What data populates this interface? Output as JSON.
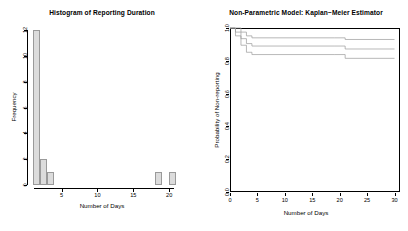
{
  "figure": {
    "background": "#ffffff",
    "panel_count": 2
  },
  "chart_data": [
    {
      "type": "bar",
      "id": "histogram-reporting-duration",
      "title": "Histogram of Reporting Duration",
      "xlabel": "Number of Days",
      "ylabel": "Frequency",
      "xlim": [
        0.6,
        21.5
      ],
      "ylim": [
        0,
        12
      ],
      "xticks": [
        5,
        10,
        15,
        20
      ],
      "yticks": [
        0,
        2,
        4,
        6,
        8,
        10,
        12
      ],
      "grid": false,
      "legend": "none",
      "bin_width": 1,
      "bar_color": "#dcdcdc",
      "bar_border": "#9a9a9a",
      "bins": [
        {
          "x0": 1,
          "x1": 2,
          "value": 12
        },
        {
          "x0": 2,
          "x1": 3,
          "value": 2
        },
        {
          "x0": 3,
          "x1": 4,
          "value": 1
        },
        {
          "x0": 18,
          "x1": 19,
          "value": 1
        },
        {
          "x0": 20,
          "x1": 21,
          "value": 1
        }
      ],
      "categories": [
        "1-2",
        "2-3",
        "3-4",
        "18-19",
        "20-21"
      ],
      "values": [
        12,
        2,
        1,
        1,
        1
      ]
    },
    {
      "type": "line",
      "id": "kaplan-meier-estimator",
      "title": "Non-Parametric Model: Kaplan−Meier Estimator",
      "xlabel": "Number of Days",
      "ylabel": "Probability of Non-reporting",
      "xlim": [
        0,
        31
      ],
      "ylim": [
        0.0,
        1.0
      ],
      "xticks": [
        0,
        5,
        10,
        15,
        20,
        25,
        30
      ],
      "yticks": [
        0.0,
        0.2,
        0.4,
        0.6,
        0.8,
        1.0
      ],
      "ytick_labels": [
        "0.0",
        "0.2",
        "0.4",
        "0.6",
        "0.8",
        "1.0"
      ],
      "grid": false,
      "legend": "none",
      "line_color": "#9a9a9a",
      "step_style": "post",
      "series": [
        {
          "name": "Upper 95% CI",
          "x": [
            0,
            1,
            2,
            3,
            4,
            19,
            21,
            30
          ],
          "values": [
            1.0,
            1.0,
            0.975,
            0.952,
            0.94,
            0.94,
            0.93,
            0.93
          ]
        },
        {
          "name": "KM estimate",
          "x": [
            0,
            1,
            2,
            3,
            4,
            19,
            21,
            30
          ],
          "values": [
            1.0,
            0.975,
            0.935,
            0.905,
            0.89,
            0.89,
            0.872,
            0.872
          ]
        },
        {
          "name": "Lower 95% CI",
          "x": [
            0,
            1,
            2,
            3,
            4,
            19,
            21,
            30
          ],
          "values": [
            1.0,
            0.952,
            0.895,
            0.852,
            0.838,
            0.838,
            0.815,
            0.815
          ]
        }
      ]
    }
  ]
}
